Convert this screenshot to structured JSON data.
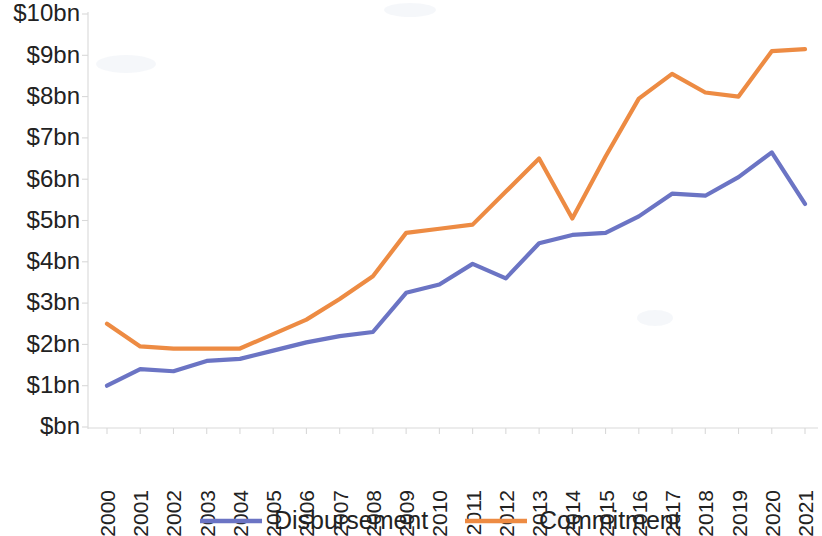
{
  "chart_data": {
    "type": "line",
    "title": "",
    "subtitle": "",
    "xlabel": "",
    "ylabel": "",
    "grid": false,
    "legend_position": "bottom",
    "x": [
      "2000",
      "2001",
      "2002",
      "2003",
      "2004",
      "2005",
      "2006",
      "2007",
      "2008",
      "2009",
      "2010",
      "2011",
      "2012",
      "2013",
      "2014",
      "2015",
      "2016",
      "2017",
      "2018",
      "2019",
      "2020",
      "2021"
    ],
    "categories": [
      "2000",
      "2001",
      "2002",
      "2003",
      "2004",
      "2005",
      "2006",
      "2007",
      "2008",
      "2009",
      "2010",
      "2011",
      "2012",
      "2013",
      "2014",
      "2015",
      "2016",
      "2017",
      "2018",
      "2019",
      "2020",
      "2021"
    ],
    "ylim": [
      0,
      10
    ],
    "ytick_values": [
      0,
      1,
      2,
      3,
      4,
      5,
      6,
      7,
      8,
      9,
      10
    ],
    "ytick_labels": [
      "$bn",
      "$1bn",
      "$2bn",
      "$3bn",
      "$4bn",
      "$5bn",
      "$6bn",
      "$7bn",
      "$8bn",
      "$9bn",
      "$10bn"
    ],
    "units": "billions of US dollars",
    "series": [
      {
        "name": "Disbursement",
        "color": "#6b74c4",
        "values": [
          1.0,
          1.4,
          1.35,
          1.6,
          1.65,
          1.85,
          2.05,
          2.2,
          2.3,
          3.25,
          3.45,
          3.95,
          3.6,
          4.45,
          4.65,
          4.7,
          5.1,
          5.65,
          5.6,
          6.05,
          6.65,
          5.4
        ]
      },
      {
        "name": "Commitment",
        "color": "#ed8b43",
        "values": [
          2.5,
          1.95,
          1.9,
          1.9,
          1.9,
          2.25,
          2.6,
          3.1,
          3.65,
          4.7,
          4.8,
          4.9,
          5.7,
          6.5,
          5.05,
          6.55,
          7.95,
          8.55,
          8.1,
          8.0,
          9.1,
          9.15
        ]
      }
    ]
  },
  "legend": {
    "items": [
      {
        "label": "Disbursement",
        "color": "#6b74c4"
      },
      {
        "label": "Commitment",
        "color": "#ed8b43"
      }
    ]
  },
  "axes": {
    "y_axis_color": "#d9d9d9",
    "x_axis_color": "#d9d9d9"
  }
}
